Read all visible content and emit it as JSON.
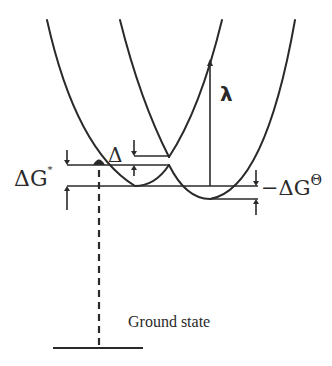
{
  "diagram": {
    "type": "potential-energy-surfaces",
    "labels": {
      "delta_g_star": "ΔG",
      "delta_g_star_sup": "*",
      "delta": "Δ",
      "lambda": "λ",
      "neg_delta_g_std": "−ΔG",
      "neg_delta_g_std_sup": "Θ",
      "ground_state": "Ground state"
    },
    "curves": [
      {
        "name": "reactant-parabola",
        "min": [
          135,
          186
        ]
      },
      {
        "name": "product-parabola",
        "min": [
          210,
          199
        ]
      },
      {
        "name": "upper-adiabatic-surface",
        "cusp": [
          169,
          157
        ]
      },
      {
        "name": "lower-adiabatic-surface",
        "cusp": [
          169,
          165
        ]
      }
    ],
    "line_color": "#2a2a2a"
  }
}
